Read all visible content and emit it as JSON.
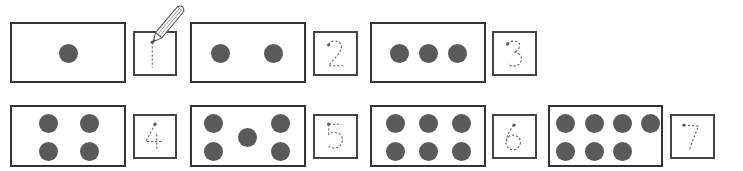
{
  "worksheet": {
    "title": "Count the dots and trace the number",
    "ink_color": "#5a5a5a",
    "border_color": "#333333",
    "rows": [
      {
        "items": [
          {
            "count": 1,
            "digit": "1",
            "has_pencil": true
          },
          {
            "count": 2,
            "digit": "2"
          },
          {
            "count": 3,
            "digit": "3"
          }
        ]
      },
      {
        "items": [
          {
            "count": 4,
            "digit": "4"
          },
          {
            "count": 5,
            "digit": "5"
          },
          {
            "count": 6,
            "digit": "6"
          },
          {
            "count": 7,
            "digit": "7"
          }
        ]
      }
    ]
  }
}
